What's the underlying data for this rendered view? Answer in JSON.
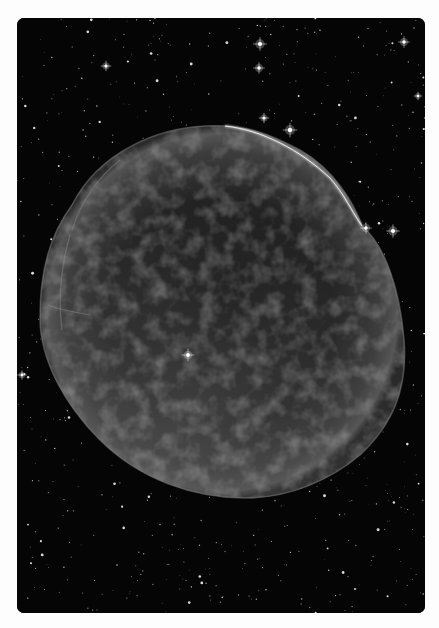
{
  "image": {
    "subject": "supernova remnant shell in a dense starfield",
    "alt": "Grayscale astronomical image of a roughly circular supernova remnant with filamentary wispy texture, brighter along the lower-left and a sharp bright filament along the upper-right rim, surrounded by many stars",
    "colors": {
      "page_background": "#fdfdfd",
      "sky": "#050505",
      "nebula_fill": "#3a3a3a",
      "nebula_rim": "#9a9a9a",
      "star": "#ffffff"
    }
  },
  "nebula": {
    "cx": 222,
    "cy": 312,
    "rx": 183,
    "ry": 187
  },
  "bright_stars": [
    {
      "x": 260,
      "y": 44,
      "r": 2.6
    },
    {
      "x": 259,
      "y": 68,
      "r": 2.2
    },
    {
      "x": 264,
      "y": 118,
      "r": 2.0
    },
    {
      "x": 290,
      "y": 130,
      "r": 2.8
    },
    {
      "x": 404,
      "y": 42,
      "r": 2.2
    },
    {
      "x": 393,
      "y": 231,
      "r": 2.6
    },
    {
      "x": 366,
      "y": 228,
      "r": 2.2
    },
    {
      "x": 188,
      "y": 355,
      "r": 2.4
    },
    {
      "x": 106,
      "y": 66,
      "r": 2.0
    },
    {
      "x": 22,
      "y": 375,
      "r": 1.8
    },
    {
      "x": 418,
      "y": 96,
      "r": 1.6
    }
  ]
}
